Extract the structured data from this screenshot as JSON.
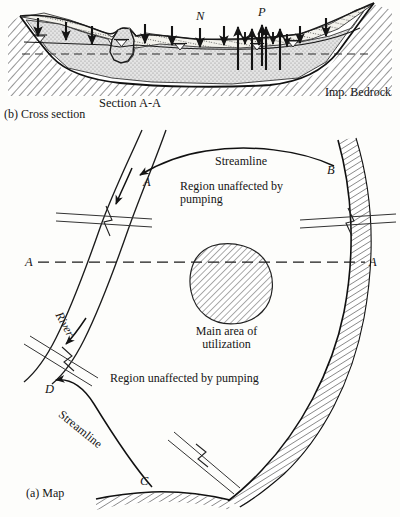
{
  "figure": {
    "caption_map": "(a) Map",
    "caption_cross_section": "(b) Cross section"
  },
  "cross_section": {
    "section_label": "Section A-A",
    "bedrock_label": "Imp. Bedrock",
    "arrow_n_label": "N",
    "arrow_p_label": "P",
    "arrow_n_meaning": "natural-recharge-downward",
    "arrow_p_meaning": "pumping-upward",
    "n_arrow_count": 7,
    "p_arrow_count": 6,
    "water_table_symbols": 5,
    "colors": {
      "aquifer_fill": "#dedede",
      "soil_fill": "#efefe9",
      "ink": "#151515",
      "bedrock_hatch": "#2a2a2a"
    }
  },
  "map": {
    "streamline_top_label": "Streamline",
    "streamline_bottom_label": "Streamline",
    "river_label": "River",
    "region_label_top": "Region unaffected by\npumping",
    "region_label_bottom": "Region unaffected by pumping",
    "main_area_label": "Main area of\nutilization",
    "section_line_left": "A",
    "section_line_right": "A",
    "points": [
      {
        "id": "A",
        "label": "A",
        "role": "streamline-endpoint-on-river"
      },
      {
        "id": "B",
        "label": "B",
        "role": "streamline-endpoint-on-boundary"
      },
      {
        "id": "C",
        "label": "C",
        "role": "streamline-endpoint-on-boundary"
      },
      {
        "id": "D",
        "label": "D",
        "role": "streamline-endpoint-on-river"
      }
    ],
    "road_crossings": 4,
    "colors": {
      "ink": "#151515",
      "dashed": "#1b1b1b",
      "hatch": "#2a2a2a"
    }
  }
}
